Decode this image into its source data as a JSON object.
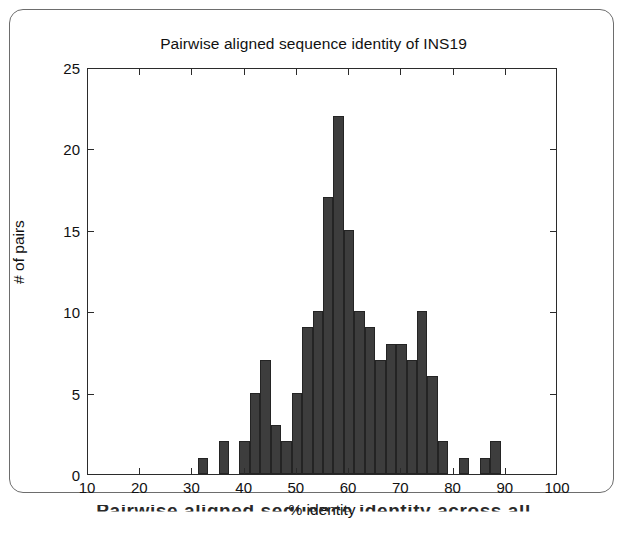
{
  "figure": {
    "title": "Pairwise aligned sequence identity of INS19",
    "caption_partial": "Pairwise aligned sequence identity across all"
  },
  "chart_data": {
    "type": "bar",
    "title": "Pairwise aligned sequence identity of INS19",
    "xlabel": "% identity",
    "ylabel": "# of pairs",
    "xlim": [
      10,
      100
    ],
    "ylim": [
      0,
      25
    ],
    "xticks": [
      10,
      20,
      30,
      40,
      50,
      60,
      70,
      80,
      90,
      100
    ],
    "yticks": [
      0,
      5,
      10,
      15,
      20,
      25
    ],
    "grid": false,
    "legend": null,
    "bin_width": 2,
    "bar_color": "#3d3d3d",
    "bin_starts": [
      31,
      35,
      39,
      41,
      43,
      45,
      47,
      49,
      51,
      53,
      55,
      57,
      59,
      61,
      63,
      65,
      67,
      69,
      71,
      73,
      75,
      77,
      81,
      85,
      87
    ],
    "categories": [
      "31",
      "35",
      "39",
      "41",
      "43",
      "45",
      "47",
      "49",
      "51",
      "53",
      "55",
      "57",
      "59",
      "61",
      "63",
      "65",
      "67",
      "69",
      "71",
      "73",
      "75",
      "77",
      "81",
      "85",
      "87"
    ],
    "values": [
      1,
      2,
      2,
      5,
      7,
      3,
      2,
      5,
      9,
      10,
      17,
      22,
      15,
      10,
      9,
      7,
      8,
      8,
      7,
      10,
      6,
      2,
      1,
      1,
      2
    ]
  },
  "axes": {
    "y_tick_labels": [
      "25",
      "20",
      "15",
      "10",
      "5",
      "0"
    ],
    "x_tick_labels": [
      "10",
      "20",
      "30",
      "40",
      "50",
      "60",
      "70",
      "80",
      "90",
      "100"
    ]
  }
}
